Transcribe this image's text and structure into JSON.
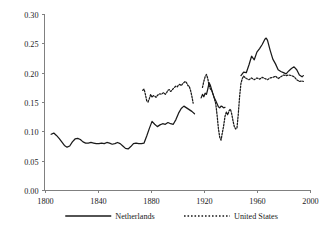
{
  "chart_data": {
    "type": "line",
    "title": "",
    "subtitle": "",
    "xlabel": "",
    "ylabel": "",
    "xlim": [
      1800,
      2000
    ],
    "ylim": [
      0.0,
      0.3
    ],
    "xticks": [
      1800,
      1840,
      1880,
      1920,
      1960,
      2000
    ],
    "xtick_labels": [
      "1800",
      "1840",
      "1880",
      "1920",
      "1960",
      "2000"
    ],
    "yticks": [
      0.0,
      0.05,
      0.1,
      0.15,
      0.2,
      0.25,
      0.3
    ],
    "ytick_labels": [
      "0.00",
      "0.05",
      "0.10",
      "0.15",
      "0.20",
      "0.25",
      "0.30"
    ],
    "grid": false,
    "legend_position": "bottom",
    "series": [
      {
        "name": "Netherlands",
        "style": "solid",
        "color": "#1a1a1a",
        "segments": [
          {
            "x": [
              1805,
              1807,
              1809,
              1811,
              1813,
              1815,
              1817,
              1819,
              1821,
              1823,
              1825,
              1827,
              1829,
              1831,
              1833,
              1835,
              1837,
              1839,
              1841,
              1843,
              1845,
              1847,
              1849,
              1851,
              1853,
              1855,
              1857,
              1859,
              1861,
              1863,
              1865,
              1867,
              1869,
              1871,
              1873,
              1875,
              1877,
              1879,
              1881,
              1883,
              1885,
              1887,
              1889,
              1891,
              1893,
              1895,
              1897,
              1899,
              1901,
              1903,
              1905,
              1907,
              1909,
              1911,
              1913
            ],
            "y": [
              0.095,
              0.097,
              0.093,
              0.088,
              0.082,
              0.076,
              0.073,
              0.075,
              0.082,
              0.087,
              0.088,
              0.086,
              0.082,
              0.08,
              0.08,
              0.081,
              0.08,
              0.079,
              0.079,
              0.08,
              0.079,
              0.081,
              0.08,
              0.078,
              0.079,
              0.081,
              0.079,
              0.075,
              0.071,
              0.07,
              0.074,
              0.079,
              0.08,
              0.079,
              0.079,
              0.08,
              0.092,
              0.105,
              0.117,
              0.112,
              0.108,
              0.111,
              0.113,
              0.112,
              0.115,
              0.113,
              0.112,
              0.12,
              0.131,
              0.139,
              0.143,
              0.14,
              0.137,
              0.134,
              0.13
            ]
          },
          {
            "x": [
              1918,
              1919,
              1920,
              1921,
              1922,
              1923,
              1924,
              1925,
              1926,
              1927,
              1928,
              1929,
              1930,
              1931,
              1932,
              1933,
              1934,
              1935,
              1936
            ],
            "y": [
              0.157,
              0.163,
              0.159,
              0.165,
              0.163,
              0.172,
              0.183,
              0.178,
              0.17,
              0.163,
              0.157,
              0.152,
              0.147,
              0.142,
              0.14,
              0.143,
              0.142,
              0.14,
              0.141
            ]
          },
          {
            "x": [
              1948,
              1950,
              1952,
              1954,
              1956,
              1958,
              1960,
              1962,
              1964,
              1966,
              1967,
              1968,
              1970,
              1972,
              1974,
              1976,
              1978,
              1980,
              1982,
              1984,
              1986,
              1988,
              1990,
              1992,
              1994,
              1995
            ],
            "y": [
              0.195,
              0.201,
              0.2,
              0.213,
              0.228,
              0.222,
              0.235,
              0.241,
              0.248,
              0.257,
              0.259,
              0.255,
              0.238,
              0.223,
              0.215,
              0.205,
              0.202,
              0.2,
              0.198,
              0.203,
              0.207,
              0.21,
              0.205,
              0.196,
              0.193,
              0.195
            ]
          }
        ]
      },
      {
        "name": "United States",
        "style": "dashed",
        "color": "#1a1a1a",
        "segments": [
          {
            "x": [
              1874,
              1875,
              1876,
              1877,
              1878,
              1879,
              1880,
              1881,
              1882,
              1883,
              1884,
              1885,
              1886,
              1887,
              1888,
              1889,
              1890,
              1891,
              1892,
              1893,
              1894,
              1895,
              1896,
              1897,
              1898,
              1899,
              1900,
              1901,
              1902,
              1903,
              1904,
              1905,
              1906,
              1907,
              1908,
              1909,
              1910,
              1911,
              1912,
              1913,
              1914,
              1915,
              1916
            ],
            "y": [
              0.17,
              0.172,
              0.163,
              0.152,
              0.15,
              0.156,
              0.163,
              0.158,
              0.161,
              0.16,
              0.158,
              0.161,
              0.163,
              0.164,
              0.163,
              0.165,
              0.166,
              0.163,
              0.166,
              0.17,
              0.171,
              0.168,
              0.17,
              0.173,
              0.175,
              0.177,
              0.176,
              0.179,
              0.18,
              0.178,
              0.181,
              0.183,
              0.185,
              0.183,
              0.178,
              0.177,
              0.17,
              0.16,
              0.148
            ]
          },
          {
            "x": [
              1919,
              1920,
              1921,
              1922,
              1923,
              1924,
              1925,
              1926,
              1927,
              1928,
              1929,
              1930,
              1931,
              1932,
              1933,
              1934,
              1935,
              1936,
              1937,
              1938,
              1939,
              1940,
              1941,
              1942,
              1943,
              1944,
              1945,
              1946,
              1947,
              1948,
              1949,
              1950
            ],
            "y": [
              0.175,
              0.185,
              0.193,
              0.197,
              0.19,
              0.178,
              0.172,
              0.17,
              0.163,
              0.155,
              0.147,
              0.128,
              0.105,
              0.09,
              0.085,
              0.098,
              0.11,
              0.126,
              0.133,
              0.128,
              0.135,
              0.138,
              0.13,
              0.118,
              0.108,
              0.104,
              0.106,
              0.13,
              0.16,
              0.182,
              0.19,
              0.194
            ]
          },
          {
            "x": [
              1950,
              1952,
              1954,
              1956,
              1958,
              1960,
              1962,
              1964,
              1966,
              1968,
              1970,
              1972,
              1974,
              1976,
              1978,
              1980,
              1982,
              1984,
              1986,
              1988,
              1990,
              1992,
              1994,
              1995
            ],
            "y": [
              0.194,
              0.19,
              0.188,
              0.191,
              0.188,
              0.191,
              0.189,
              0.192,
              0.19,
              0.188,
              0.191,
              0.192,
              0.194,
              0.19,
              0.193,
              0.196,
              0.195,
              0.196,
              0.195,
              0.193,
              0.188,
              0.185,
              0.186,
              0.185
            ]
          }
        ]
      }
    ],
    "legend": [
      {
        "label": "Netherlands",
        "style": "solid"
      },
      {
        "label": "United States",
        "style": "dashed"
      }
    ]
  }
}
